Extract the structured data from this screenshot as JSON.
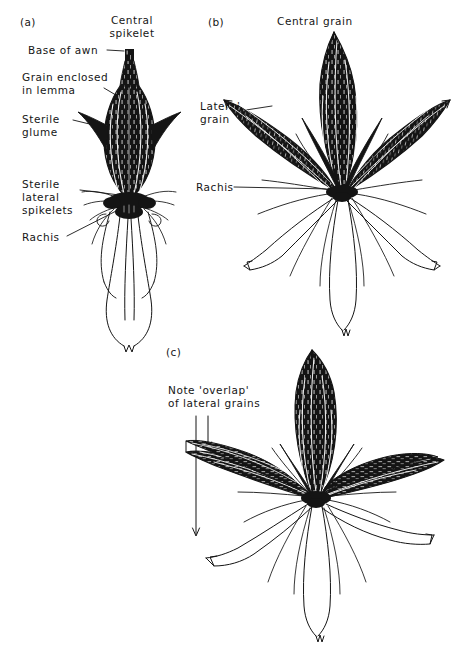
{
  "figure": {
    "background_color": "#ffffff",
    "ink_color": "#111111",
    "width": 465,
    "height": 647
  },
  "panels": [
    {
      "id": "a",
      "tag": "(a)",
      "specimen": "central-spikelet-with-sterile-lateral-spikelets",
      "labels": [
        {
          "name": "central-spikelet",
          "text": "Central\nspikelet",
          "align": "center"
        },
        {
          "name": "base-of-awn",
          "text": "Base of awn"
        },
        {
          "name": "grain-enclosed-in-lemma",
          "text": "Grain enclosed\nin lemma"
        },
        {
          "name": "sterile-glume",
          "text": "Sterile\nglume"
        },
        {
          "name": "sterile-lateral-spikelets",
          "text": "Sterile\nlateral\nspikelets"
        },
        {
          "name": "rachis",
          "text": "Rachis"
        }
      ]
    },
    {
      "id": "b",
      "tag": "(b)",
      "specimen": "rosette-of-central-and-lateral-grains",
      "labels": [
        {
          "name": "central-grain",
          "text": "Central grain"
        },
        {
          "name": "lateral-grain",
          "text": "Lateral\ngrain"
        },
        {
          "name": "rachis",
          "text": "Rachis"
        }
      ]
    },
    {
      "id": "c",
      "tag": "(c)",
      "specimen": "overlapping-lateral-grains-rosette",
      "labels": [
        {
          "name": "note-overlap",
          "text": "Note 'overlap'\nof lateral grains"
        }
      ]
    }
  ]
}
